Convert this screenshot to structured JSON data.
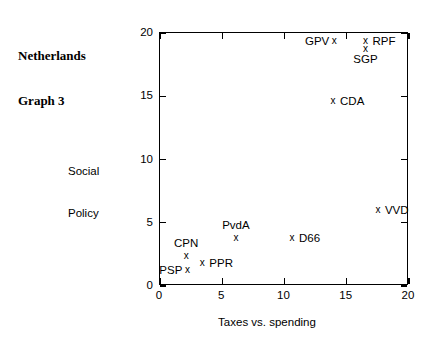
{
  "title": {
    "line1": "Netherlands",
    "line2": "Graph 3"
  },
  "chart_data": {
    "type": "scatter",
    "title": "Netherlands Graph 3",
    "xlabel": "Taxes vs. spending",
    "ylabel": "Social Policy",
    "ylabel_line1": "Social",
    "ylabel_line2": "Policy",
    "xlim": [
      0,
      20
    ],
    "ylim": [
      0,
      20
    ],
    "xticks": [
      0,
      5,
      10,
      15,
      20
    ],
    "yticks": [
      0,
      5,
      10,
      15,
      20
    ],
    "xticklabels": [
      "0",
      "5",
      "10",
      "15",
      "20"
    ],
    "yticklabels": [
      "0",
      "5",
      "10",
      "15",
      "20"
    ],
    "grid": false,
    "legend": false,
    "marker": "x",
    "marker_color": "#000000",
    "points": [
      {
        "label": "GPV",
        "x": 14.0,
        "y": 19.4,
        "label_pos": "left"
      },
      {
        "label": "RPF",
        "x": 16.5,
        "y": 19.4,
        "label_pos": "right"
      },
      {
        "label": "SGP",
        "x": 16.5,
        "y": 18.7,
        "label_pos": "below"
      },
      {
        "label": "CDA",
        "x": 13.9,
        "y": 14.6,
        "label_pos": "right"
      },
      {
        "label": "VVD",
        "x": 17.5,
        "y": 6.0,
        "label_pos": "right"
      },
      {
        "label": "D66",
        "x": 10.6,
        "y": 3.8,
        "label_pos": "right"
      },
      {
        "label": "PvdA",
        "x": 6.1,
        "y": 3.8,
        "label_pos": "above"
      },
      {
        "label": "CPN",
        "x": 2.1,
        "y": 2.4,
        "label_pos": "above"
      },
      {
        "label": "PPR",
        "x": 3.4,
        "y": 1.8,
        "label_pos": "right"
      },
      {
        "label": "PSP",
        "x": 2.2,
        "y": 1.3,
        "label_pos": "left"
      }
    ]
  }
}
